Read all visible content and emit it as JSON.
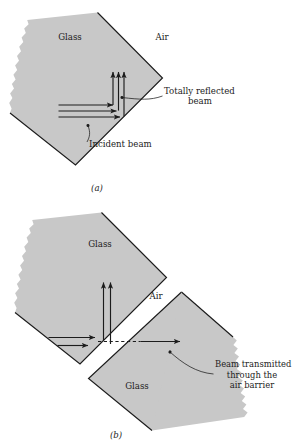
{
  "figure": {
    "colors": {
      "glass_fill": "#c8c8c8",
      "outline": "#1c1c1c",
      "ray": "#1c1c1c",
      "leader": "#1c1c1c",
      "background": "#ffffff"
    }
  },
  "panel_a": {
    "caption": "(a)",
    "labels": {
      "glass": "Glass",
      "air": "Air",
      "totally_reflected_line1": "Totally reflected",
      "totally_reflected_line2": "beam",
      "incident_beam": "Incident beam"
    },
    "rays": {
      "incident_count": 3,
      "reflected_count": 3,
      "incident_direction": "right",
      "reflected_direction": "up"
    }
  },
  "panel_b": {
    "caption": "(b)",
    "labels": {
      "glass_upper": "Glass",
      "air": "Air",
      "glass_lower": "Glass",
      "transmitted_line1": "Beam transmitted",
      "transmitted_line2": "through the",
      "transmitted_line3": "air barrier"
    },
    "rays": {
      "incident_count": 2,
      "reflected_count": 2,
      "transmitted_count": 1,
      "evanescent_dashed": true,
      "incident_direction": "right",
      "reflected_direction": "up",
      "transmitted_direction": "right"
    }
  }
}
